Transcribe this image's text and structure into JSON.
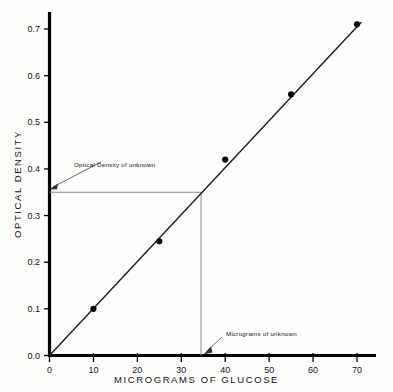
{
  "chart_data": {
    "type": "scatter",
    "title": "",
    "xlabel": "MICROGRAMS OF GLUCOSE",
    "ylabel": "OPTICAL DENSITY",
    "xlim": [
      0,
      75
    ],
    "ylim": [
      0.0,
      0.75
    ],
    "xticks": [
      "0",
      "10",
      "20",
      "30",
      "40",
      "50",
      "60",
      "70"
    ],
    "xtick_values": [
      0,
      10,
      20,
      30,
      40,
      50,
      60,
      70
    ],
    "yticks": [
      "0.0",
      "0.1",
      "0.2",
      "0.3",
      "0.4",
      "0.5",
      "0.6",
      "0.7"
    ],
    "ytick_values": [
      0.0,
      0.1,
      0.2,
      0.3,
      0.4,
      0.5,
      0.6,
      0.7
    ],
    "grid": false,
    "legend": null,
    "x": [
      10,
      25,
      40,
      55,
      70
    ],
    "values": [
      0.1,
      0.245,
      0.42,
      0.56,
      0.71
    ],
    "series": [
      {
        "name": "glucose standard curve",
        "marker": "filled-circle",
        "points": [
          {
            "x": 10,
            "y": 0.1
          },
          {
            "x": 25,
            "y": 0.245
          },
          {
            "x": 40,
            "y": 0.42
          },
          {
            "x": 55,
            "y": 0.56
          },
          {
            "x": 70,
            "y": 0.71
          }
        ]
      }
    ],
    "fit_line": {
      "x0": 0,
      "y0": 0.0,
      "x1": 71,
      "y1": 0.715
    },
    "annotations": [
      {
        "text": "Optical Density of unknown",
        "points_to": {
          "x": 0,
          "y": 0.35
        },
        "guide_axis": "y"
      },
      {
        "text": "Micrograms of unknown",
        "points_to": {
          "x": 34.5,
          "y": 0.0
        },
        "guide_axis": "x"
      }
    ],
    "unknown": {
      "x": 34.5,
      "y": 0.35
    }
  },
  "colors": {
    "axis": "#000000",
    "line": "#1a1a1a",
    "marker": "#000000",
    "guide": "#8a8a8a",
    "background": "#fdfdfc"
  }
}
